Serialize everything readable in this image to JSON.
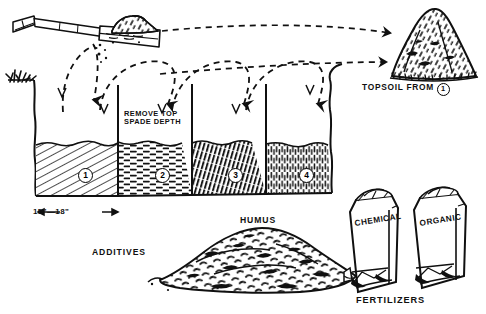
{
  "diagram": {
    "ink_color": "#0d0d0d",
    "background_color": "#ffffff"
  },
  "labels": {
    "remove_top_spade_depth": "REMOVE TOP\nSPADE DEPTH",
    "remove_line1": "REMOVE TOP",
    "remove_line2": "SPADE DEPTH",
    "topsoil_from": "TOPSOIL FROM",
    "topsoil_from_number": "1",
    "trench_width": "15\"—18\"",
    "trench_width_full": "← 15\"—18\" →",
    "additives": "ADDITIVES",
    "humus": "HUMUS",
    "fertilizers": "FERTILIZERS"
  },
  "trench": {
    "sections": [
      {
        "number": "1",
        "texture": "diagonal-fine-hatch"
      },
      {
        "number": "2",
        "texture": "horizontal-dashes"
      },
      {
        "number": "3",
        "texture": "dense-diagonal-strokes"
      },
      {
        "number": "4",
        "texture": "vertical-speckle-strokes"
      }
    ]
  },
  "bags": [
    {
      "label": "CHEMICAL"
    },
    {
      "label": "ORGANIC"
    }
  ],
  "piles": [
    {
      "name": "topsoil-mound",
      "label": "TOPSOIL FROM 1"
    },
    {
      "name": "humus-pile",
      "label": "HUMUS"
    }
  ],
  "icons": {
    "spade": "spade-icon",
    "grass_tuft": "grass-tuft-icon",
    "arrow_arc": "curved-dashed-arrow-icon",
    "arrow_long": "long-dashed-arrow-icon",
    "circled_number": "circled-number-icon"
  }
}
